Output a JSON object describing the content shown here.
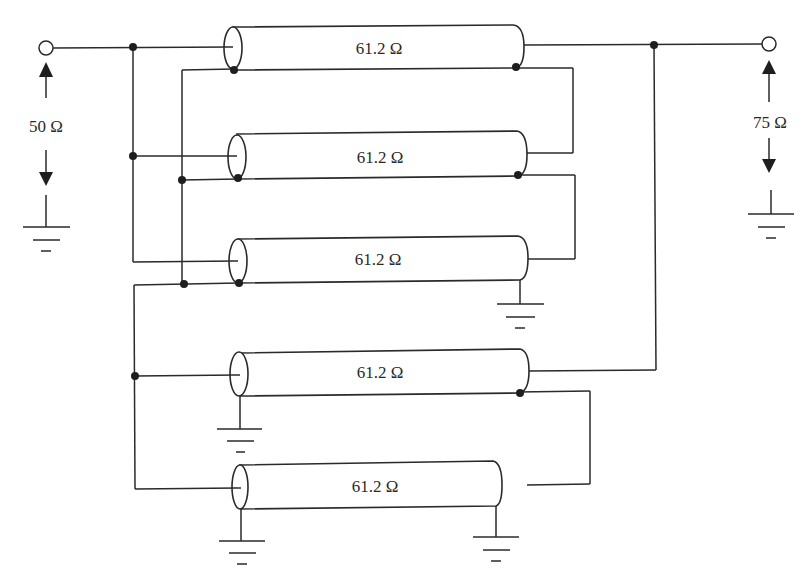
{
  "diagram": {
    "type": "coaxial transmission-line transformer schematic",
    "input": {
      "impedance_label": "50 Ω"
    },
    "output": {
      "impedance_label": "75 Ω"
    },
    "lines": [
      {
        "id": "line-1",
        "label": "61.2 Ω"
      },
      {
        "id": "line-2",
        "label": "61.2 Ω"
      },
      {
        "id": "line-3",
        "label": "61.2 Ω"
      },
      {
        "id": "line-4",
        "label": "61.2 Ω"
      },
      {
        "id": "line-5",
        "label": "61.2 Ω"
      }
    ],
    "colors": {
      "stroke": "#2a2a2a",
      "background": "#ffffff"
    }
  }
}
